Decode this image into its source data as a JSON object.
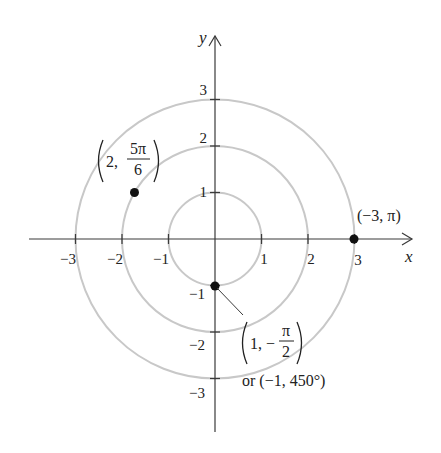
{
  "diagram": {
    "type": "polar-coordinate-plot",
    "origin_px": [
      215,
      239
    ],
    "unit_px": 46.5,
    "axes": {
      "x_label": "x",
      "y_label": "y",
      "x_ticks": [
        "−3",
        "−2",
        "−1",
        "1",
        "2",
        "3"
      ],
      "y_ticks": [
        "3",
        "2",
        "1",
        "−1",
        "−2",
        "−3"
      ]
    },
    "circles": {
      "radii": [
        1,
        2,
        3
      ],
      "color": "#c8c8c8"
    },
    "points": [
      {
        "id": "p1",
        "r": 2,
        "theta": "5π/6",
        "cartesian": [
          -1.732,
          1
        ],
        "label_r": "2,",
        "label_num": "5π",
        "label_den": "6"
      },
      {
        "id": "p2",
        "r": -3,
        "theta": "π",
        "cartesian": [
          3,
          0
        ],
        "label": "(−3, π)"
      },
      {
        "id": "p3",
        "r": 1,
        "theta": "−π/2",
        "cartesian": [
          0,
          -1
        ],
        "label_r": "1, −",
        "label_num": "π",
        "label_den": "2",
        "label_alt": "or (−1, 450°)"
      }
    ],
    "colors": {
      "axis": "#3a3a3a",
      "circle": "#c8c8c8",
      "point": "#111111",
      "text": "#222222"
    }
  }
}
